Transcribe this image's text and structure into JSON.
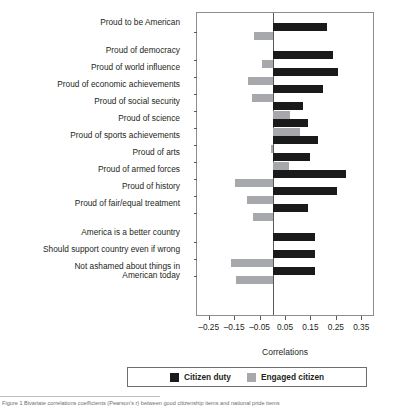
{
  "chart_data": {
    "type": "bar",
    "orientation": "horizontal",
    "title": "",
    "xlabel": "Correlations",
    "ylabel": "",
    "xlim": [
      -0.3,
      0.4
    ],
    "xticks": [
      -0.25,
      -0.15,
      -0.05,
      0.05,
      0.15,
      0.25,
      0.35
    ],
    "xticklabels": [
      "–0.25",
      "–0.15",
      "–0.05",
      "0.05",
      "0.15",
      "0.25",
      "0.35"
    ],
    "grid": false,
    "legend_position": "bottom",
    "categories": [
      "Proud to be American",
      "Proud of democracy",
      "Proud of world influence",
      "Proud of economic achievements",
      "Proud of social security",
      "Proud of science",
      "Proud of sports achievements",
      "Proud of arts",
      "Proud of armed forces",
      "Proud of history",
      "Proud of fair/equal treatment",
      "America is a better country",
      "Should support country even if wrong",
      "Not ashamed about things in\nAmerican today"
    ],
    "series": [
      {
        "name": "Citizen duty",
        "color": "#1a1a1a",
        "values": [
          0.21,
          0.235,
          0.255,
          0.195,
          0.115,
          0.135,
          0.175,
          0.145,
          0.285,
          0.25,
          0.135,
          0.165,
          0.165,
          0.165
        ]
      },
      {
        "name": "Engaged citizen",
        "color": "#a6a8ab",
        "values": [
          -0.075,
          -0.045,
          -0.1,
          -0.085,
          0.065,
          0.105,
          -0.01,
          0.06,
          -0.15,
          -0.105,
          -0.08,
          0.0,
          -0.165,
          -0.145
        ]
      }
    ]
  },
  "legend": {
    "items": [
      {
        "label": "Citizen duty",
        "swatch": "black"
      },
      {
        "label": "Engaged citizen",
        "swatch": "gray"
      }
    ]
  },
  "axis": {
    "x_title": "Correlations"
  },
  "caption": {
    "text": "Figure 1   Bivariate correlations coefficients (Pearson’s r) between good citizenship items and national pride items"
  }
}
